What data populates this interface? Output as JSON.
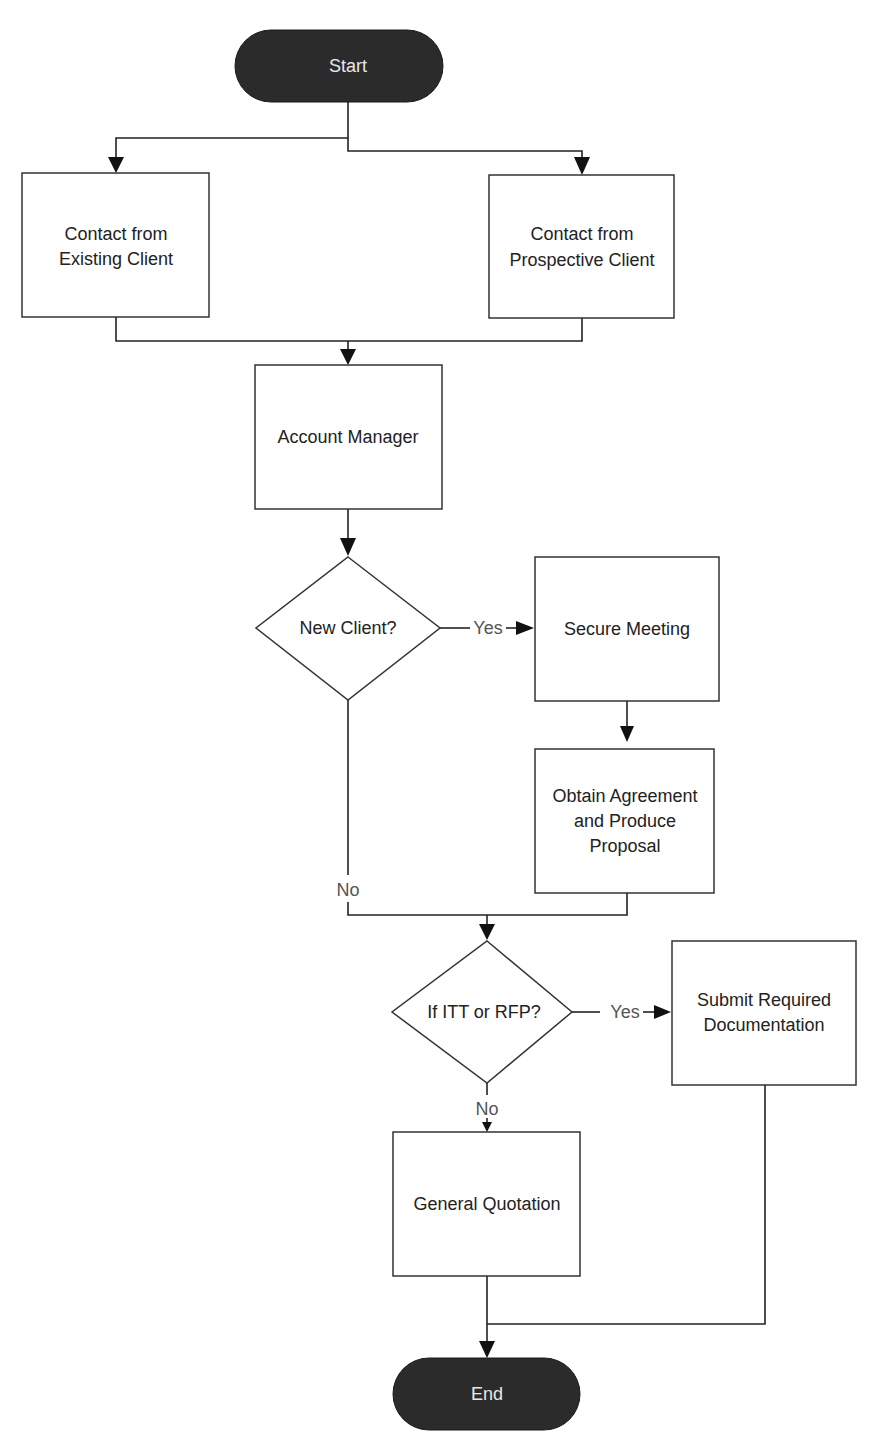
{
  "diagram": {
    "type": "flowchart",
    "colors": {
      "terminal_fill": "#2b2b2b",
      "terminal_text": "#e8e8e8",
      "box_stroke": "#333333",
      "line": "#222222",
      "label_text": "#555555"
    },
    "nodes": {
      "start": {
        "label": "Start",
        "shape": "terminal"
      },
      "existing_client": {
        "lines": [
          "Contact from",
          "Existing Client"
        ],
        "shape": "process"
      },
      "prospective_client": {
        "lines": [
          "Contact from",
          "Prospective Client"
        ],
        "shape": "process"
      },
      "account_manager": {
        "lines": [
          "Account Manager"
        ],
        "shape": "process"
      },
      "new_client": {
        "lines": [
          "New Client?"
        ],
        "shape": "decision"
      },
      "secure_meeting": {
        "lines": [
          "Secure Meeting"
        ],
        "shape": "process"
      },
      "obtain_agreement": {
        "lines": [
          "Obtain Agreement",
          "and Produce",
          "Proposal"
        ],
        "shape": "process"
      },
      "itt_rfp": {
        "lines": [
          "If ITT or RFP?"
        ],
        "shape": "decision"
      },
      "submit_docs": {
        "lines": [
          "Submit Required",
          "Documentation"
        ],
        "shape": "process"
      },
      "general_quotation": {
        "lines": [
          "General Quotation"
        ],
        "shape": "process"
      },
      "end": {
        "label": "End",
        "shape": "terminal"
      }
    },
    "edge_labels": {
      "new_client_yes": "Yes",
      "new_client_no": "No",
      "itt_rfp_yes": "Yes",
      "itt_rfp_no": "No"
    },
    "edges": [
      {
        "from": "start",
        "to": "existing_client"
      },
      {
        "from": "start",
        "to": "prospective_client"
      },
      {
        "from": "existing_client",
        "to": "account_manager"
      },
      {
        "from": "prospective_client",
        "to": "account_manager"
      },
      {
        "from": "account_manager",
        "to": "new_client"
      },
      {
        "from": "new_client",
        "to": "secure_meeting",
        "label": "Yes"
      },
      {
        "from": "new_client",
        "to": "itt_rfp",
        "label": "No"
      },
      {
        "from": "secure_meeting",
        "to": "obtain_agreement"
      },
      {
        "from": "obtain_agreement",
        "to": "itt_rfp"
      },
      {
        "from": "itt_rfp",
        "to": "submit_docs",
        "label": "Yes"
      },
      {
        "from": "itt_rfp",
        "to": "general_quotation",
        "label": "No"
      },
      {
        "from": "general_quotation",
        "to": "end"
      },
      {
        "from": "submit_docs",
        "to": "end"
      }
    ]
  }
}
